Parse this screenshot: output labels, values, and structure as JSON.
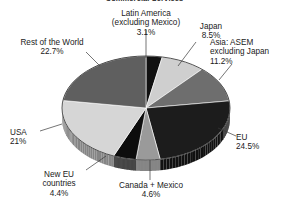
{
  "chart_title": "Commercial Services",
  "chart_data": {
    "type": "pie",
    "title": "Commercial Services",
    "subtitle": "",
    "xlabel": "",
    "ylabel": "",
    "legend_position": "none",
    "labels_on_slices": false,
    "three_d": true,
    "start_angle_deg": 0,
    "direction": "clockwise",
    "categories": [
      "Latin America (excluding Mexico)",
      "Japan",
      "Asia: ASEM excluding Japan",
      "EU",
      "Canada + Mexico",
      "New EU countries",
      "USA",
      "Rest of the World"
    ],
    "values": [
      3.1,
      8.5,
      11.2,
      24.5,
      4.6,
      4.4,
      21.0,
      22.7
    ],
    "unit": "%",
    "total": 100.0,
    "slices": [
      {
        "name": "Latin America (excluding Mexico)",
        "label_line1": "Latin America",
        "label_line2": "(excluding Mexico)",
        "value": 3.1,
        "value_text": "3.1%",
        "color": "#111111"
      },
      {
        "name": "Japan",
        "label_line1": "Japan",
        "label_line2": "",
        "value": 8.5,
        "value_text": "8.5%",
        "color": "#cfcfcf"
      },
      {
        "name": "Asia: ASEM excluding Japan",
        "label_line1": "Asia: ASEM",
        "label_line2": "excluding Japan",
        "value": 11.2,
        "value_text": "11.2%",
        "color": "#6e6e6e"
      },
      {
        "name": "EU",
        "label_line1": "EU",
        "label_line2": "",
        "value": 24.5,
        "value_text": "24.5%",
        "color": "#1c1c1c"
      },
      {
        "name": "Canada + Mexico",
        "label_line1": "Canada + Mexico",
        "label_line2": "",
        "value": 4.6,
        "value_text": "4.6%",
        "color": "#9a9a9a"
      },
      {
        "name": "New EU countries",
        "label_line1": "New EU",
        "label_line2": "countries",
        "value": 4.4,
        "value_text": "4.4%",
        "color": "#0d0d0d"
      },
      {
        "name": "USA",
        "label_line1": "USA",
        "label_line2": "",
        "value": 21.0,
        "value_text": "21%",
        "color": "#d6d6d6"
      },
      {
        "name": "Rest of the World",
        "label_line1": "Rest of the World",
        "label_line2": "",
        "value": 22.7,
        "value_text": "22.7%",
        "color": "#5f5f5f"
      }
    ]
  },
  "labels": {
    "latin_america_l1": "Latin America",
    "latin_america_l2": "(excluding Mexico)",
    "latin_america_pct": "3.1%",
    "japan_l1": "Japan",
    "japan_pct": "8.5%",
    "asem_l1": "Asia: ASEM",
    "asem_l2": "excluding Japan",
    "asem_pct": "11.2%",
    "eu_l1": "EU",
    "eu_pct": "24.5%",
    "canada_mexico_l1": "Canada + Mexico",
    "canada_mexico_pct": "4.6%",
    "new_eu_l1": "New EU",
    "new_eu_l2": "countries",
    "new_eu_pct": "4.4%",
    "usa_l1": "USA",
    "usa_pct": "21%",
    "rest_world_l1": "Rest of the World",
    "rest_world_pct": "22.7%"
  }
}
